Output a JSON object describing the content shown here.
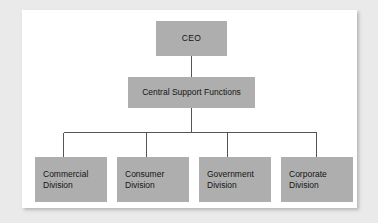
{
  "diagram": {
    "type": "organizational-chart",
    "orientation": "top-down",
    "colors": {
      "node_fill": "#aeaeae",
      "node_text": "#141414",
      "connector": "#555555",
      "panel_background": "#ffffff",
      "canvas_background": "#eaeaea"
    },
    "nodes": {
      "root": {
        "label": "CEO",
        "level": 0
      },
      "support": {
        "label": "Central Support Functions",
        "level": 1
      },
      "divisions": [
        {
          "label": "Commercial\nDivision",
          "level": 2
        },
        {
          "label": "Consumer\nDivision",
          "level": 2
        },
        {
          "label": "Government\nDivision",
          "level": 2
        },
        {
          "label": "Corporate\nDivision",
          "level": 2
        }
      ]
    },
    "connections": [
      {
        "from": "CEO",
        "to": "Central Support Functions"
      },
      {
        "from": "Central Support Functions",
        "to": "Commercial Division"
      },
      {
        "from": "Central Support Functions",
        "to": "Consumer Division"
      },
      {
        "from": "Central Support Functions",
        "to": "Government Division"
      },
      {
        "from": "Central Support Functions",
        "to": "Corporate Division"
      }
    ]
  }
}
